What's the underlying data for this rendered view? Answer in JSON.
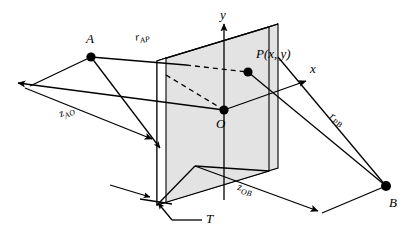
{
  "figure": {
    "background_color": "#ffffff",
    "line_color": "#000000",
    "plate_fill_color": "#e3e3e3",
    "plate_edge_color": "#ffffff",
    "width": 412,
    "height": 231
  },
  "axes": [
    {
      "name": "y-axis",
      "label": "y",
      "direction": "up"
    },
    {
      "name": "x-axis",
      "label": "x",
      "direction": "right-up"
    },
    {
      "name": "z-axis",
      "label": "",
      "direction": "left-up"
    }
  ],
  "points": [
    {
      "id": "A",
      "label": "A",
      "description": "source point left of plate"
    },
    {
      "id": "P",
      "label": "P(x, y)",
      "description": "field point on plate surface"
    },
    {
      "id": "O",
      "label": "O",
      "description": "origin at plate center"
    },
    {
      "id": "B",
      "label": "B",
      "description": "receiver point right of plate"
    }
  ],
  "dimensions": [
    {
      "id": "r_AP",
      "base": "r",
      "subscript": "AP",
      "description": "distance from A to P"
    },
    {
      "id": "z_AO",
      "base": "z",
      "subscript": "AO",
      "description": "axial distance from A to O"
    },
    {
      "id": "r_PB",
      "base": "r",
      "subscript": "PB",
      "description": "distance from P to B"
    },
    {
      "id": "z_OB",
      "base": "z",
      "subscript": "OB",
      "description": "axial distance from O to B"
    },
    {
      "id": "T",
      "base": "T",
      "subscript": "",
      "description": "plate thickness"
    }
  ]
}
